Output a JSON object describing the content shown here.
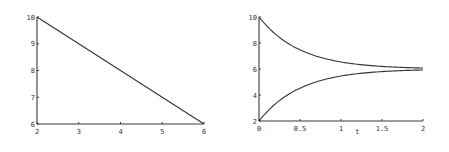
{
  "chart_data": [
    {
      "type": "line",
      "title": "",
      "xlabel": "",
      "ylabel": "",
      "xlim": [
        2,
        6
      ],
      "ylim": [
        6,
        10
      ],
      "xticks": [
        "2",
        "3",
        "4",
        "5",
        "6"
      ],
      "yticks": [
        "6",
        "7",
        "8",
        "9",
        "10"
      ],
      "grid": false,
      "series": [
        {
          "name": "line",
          "x": [
            2,
            3,
            4,
            5,
            6
          ],
          "y": [
            10,
            9,
            8,
            7,
            6
          ]
        }
      ],
      "plot_box": {
        "x0": 37,
        "x1": 204,
        "y0": 124,
        "y1": 17
      }
    },
    {
      "type": "line",
      "title": "",
      "xlabel": "t",
      "ylabel": "",
      "xlim": [
        0,
        2
      ],
      "ylim": [
        2,
        10
      ],
      "xticks": [
        "0",
        "0.5",
        "1",
        "1.5",
        "2"
      ],
      "yticks": [
        "2",
        "4",
        "6",
        "8",
        "10"
      ],
      "grid": false,
      "series": [
        {
          "name": "upper (decaying from 10 to 6)",
          "x": [
            0,
            0.25,
            0.5,
            0.75,
            1,
            1.25,
            1.5,
            1.75,
            2
          ],
          "y": [
            10,
            8.43,
            7.47,
            6.89,
            6.54,
            6.33,
            6.2,
            6.12,
            6.07
          ]
        },
        {
          "name": "lower (rising from 2 to 6)",
          "x": [
            0,
            0.25,
            0.5,
            0.75,
            1,
            1.25,
            1.5,
            1.75,
            2
          ],
          "y": [
            2,
            3.57,
            4.53,
            5.11,
            5.46,
            5.67,
            5.8,
            5.88,
            5.93
          ]
        }
      ],
      "plot_box": {
        "x0": 259,
        "x1": 423,
        "y0": 121,
        "y1": 17
      }
    }
  ]
}
